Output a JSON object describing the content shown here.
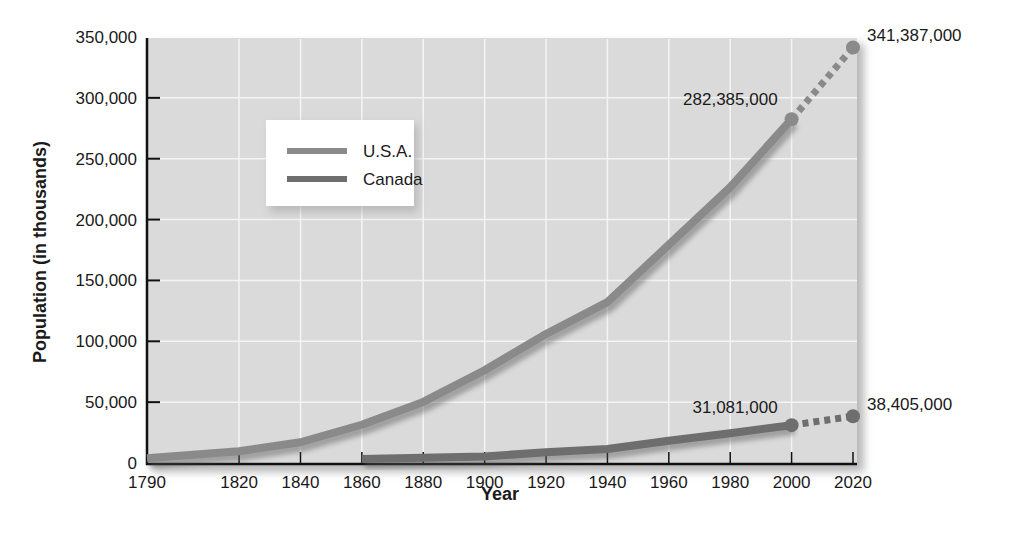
{
  "chart_data": {
    "type": "line",
    "title": "",
    "xlabel": "Year",
    "ylabel": "Population (in thousands)",
    "ylim": [
      0,
      350000
    ],
    "xlim": [
      1790,
      2020
    ],
    "grid": true,
    "legend_position": "upper-left (inset)",
    "x_ticks": [
      "1790",
      "1820",
      "1840",
      "1860",
      "1880",
      "1900",
      "1920",
      "1940",
      "1960",
      "1980",
      "2000",
      "2020"
    ],
    "y_ticks": [
      "0",
      "50,000",
      "100,000",
      "150,000",
      "200,000",
      "250,000",
      "300,000",
      "350,000"
    ],
    "series": [
      {
        "name": "U.S.A.",
        "color": "#8a8a8a",
        "x": [
          1790,
          1820,
          1840,
          1860,
          1880,
          1900,
          1920,
          1940,
          1960,
          1980,
          2000
        ],
        "values": [
          3929,
          9638,
          17069,
          31443,
          50189,
          76212,
          106022,
          132165,
          179323,
          226546,
          282385
        ],
        "projected": {
          "x": [
            2000,
            2020
          ],
          "values": [
            282385,
            341387
          ]
        }
      },
      {
        "name": "Canada",
        "color": "#6e6e6e",
        "x": [
          1860,
          1880,
          1900,
          1920,
          1940,
          1960,
          1980,
          2000
        ],
        "values": [
          3230,
          4325,
          5371,
          8788,
          11507,
          18238,
          24517,
          31081
        ],
        "projected": {
          "x": [
            2000,
            2020
          ],
          "values": [
            31081,
            38405
          ]
        }
      }
    ],
    "annotations": [
      {
        "text": "282,385,000",
        "x": 2000,
        "y": 282385,
        "series": "U.S.A."
      },
      {
        "text": "341,387,000",
        "x": 2020,
        "y": 341387,
        "series": "U.S.A."
      },
      {
        "text": "31,081,000",
        "x": 2000,
        "y": 31081,
        "series": "Canada"
      },
      {
        "text": "38,405,000",
        "x": 2020,
        "y": 38405,
        "series": "Canada"
      }
    ]
  },
  "legend": {
    "items": [
      {
        "label": "U.S.A."
      },
      {
        "label": "Canada"
      }
    ]
  },
  "axes": {
    "x_title": "Year",
    "y_title": "Population (in thousands)"
  }
}
